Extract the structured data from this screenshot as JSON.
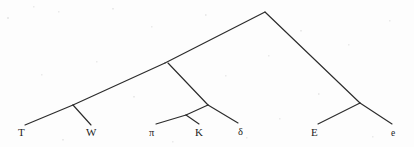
{
  "figure": {
    "type": "phylogenetic-tree-diagram",
    "orientation": "root-at-top-leaves-at-bottom",
    "background_color": "#fdfdfd",
    "line_color": "#2b2b2b"
  },
  "leaves": [
    {
      "id": "leaf-t",
      "label": "T",
      "x": 18,
      "y": 127,
      "tip_x": 25,
      "tip_y": 125,
      "style": "roman"
    },
    {
      "id": "leaf-w",
      "label": "W",
      "x": 86,
      "y": 127,
      "tip_x": 91,
      "tip_y": 125,
      "style": "roman"
    },
    {
      "id": "leaf-pi",
      "label": "π",
      "x": 149,
      "y": 128,
      "tip_x": 156,
      "tip_y": 124,
      "style": "greek"
    },
    {
      "id": "leaf-k",
      "label": "K",
      "x": 195,
      "y": 127,
      "tip_x": 199,
      "tip_y": 124,
      "style": "roman"
    },
    {
      "id": "leaf-delta",
      "label": "δ",
      "x": 238,
      "y": 127,
      "tip_x": 238,
      "tip_y": 123,
      "style": "greek"
    },
    {
      "id": "leaf-e-cap",
      "label": "E",
      "x": 311,
      "y": 127,
      "tip_x": 318,
      "tip_y": 124,
      "style": "roman"
    },
    {
      "id": "leaf-e-low",
      "label": "e",
      "x": 391,
      "y": 129,
      "tip_x": 392,
      "tip_y": 124,
      "style": "small"
    }
  ],
  "nodes": [
    {
      "id": "node-root",
      "x": 265,
      "y": 12
    },
    {
      "id": "node-left-main",
      "x": 165,
      "y": 63
    },
    {
      "id": "node-delta",
      "x": 208,
      "y": 105
    },
    {
      "id": "node-pi-k",
      "x": 186,
      "y": 115
    },
    {
      "id": "node-t-w",
      "x": 73,
      "y": 105
    },
    {
      "id": "node-e-e",
      "x": 360,
      "y": 103
    }
  ],
  "edges": [
    {
      "id": "edge-root-left",
      "from": "node-root",
      "to": "node-left-main",
      "path": "M265,12 L165,63"
    },
    {
      "id": "edge-left-to-t",
      "from": "node-left-main",
      "to": "node-t-w",
      "path": "M165,63 L73,105"
    },
    {
      "id": "edge-tw-to-t",
      "from": "node-t-w",
      "to": "leaf-t",
      "path": "M73,105 L25,125"
    },
    {
      "id": "edge-tw-to-w",
      "from": "node-t-w",
      "to": "leaf-w",
      "path": "M73,105 L91,125"
    },
    {
      "id": "edge-left-to-delta",
      "from": "node-left-main",
      "to": "node-delta",
      "path": "M168,63 L208,105"
    },
    {
      "id": "edge-delta-tip",
      "from": "node-delta",
      "to": "leaf-delta",
      "path": "M208,105 L238,123"
    },
    {
      "id": "edge-delta-to-pik",
      "from": "node-delta",
      "to": "node-pi-k",
      "path": "M208,105 L186,115"
    },
    {
      "id": "edge-pik-to-pi",
      "from": "node-pi-k",
      "to": "leaf-pi",
      "path": "M186,115 L156,124"
    },
    {
      "id": "edge-pik-to-k",
      "from": "node-pi-k",
      "to": "leaf-k",
      "path": "M186,115 L199,124"
    },
    {
      "id": "edge-root-right",
      "from": "node-root",
      "to": "node-e-e",
      "path": "M265,12 L360,103"
    },
    {
      "id": "edge-ee-to-ecap",
      "from": "node-e-e",
      "to": "leaf-e-cap",
      "path": "M360,103 L318,124"
    },
    {
      "id": "edge-ee-to-elow",
      "from": "node-e-e",
      "to": "leaf-e-low",
      "path": "M360,103 L392,124"
    }
  ]
}
